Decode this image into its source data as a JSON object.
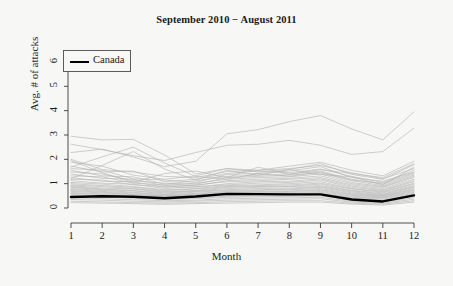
{
  "chart_data": {
    "type": "line",
    "title": "September 2010 − August 2011",
    "xlabel": "Month",
    "ylabel": "Avg. # of attacks",
    "x": [
      1,
      2,
      3,
      4,
      5,
      6,
      7,
      8,
      9,
      10,
      11,
      12
    ],
    "xticklabels": [
      "1",
      "2",
      "3",
      "4",
      "5",
      "6",
      "7",
      "8",
      "9",
      "10",
      "11",
      "12"
    ],
    "yticklabels": [
      "0",
      "1",
      "2",
      "3",
      "4",
      "5",
      "6"
    ],
    "xlim": [
      1,
      12
    ],
    "ylim": [
      0,
      6.3
    ],
    "grid": false,
    "legend": {
      "position": "top-left",
      "entries": [
        {
          "label": "Canada",
          "color": "#000000",
          "linewidth": 2.4
        }
      ]
    },
    "highlight_color": "#000000",
    "other_series_color": "#b4b4b4",
    "background_color": "#f7f7f6",
    "series": [
      {
        "name": "Canada",
        "highlight": true,
        "values": [
          0.45,
          0.48,
          0.46,
          0.4,
          0.47,
          0.58,
          0.57,
          0.56,
          0.56,
          0.35,
          0.27,
          0.52
        ]
      },
      {
        "name": "Country 1",
        "highlight": false,
        "values": [
          2.95,
          2.8,
          2.82,
          2.18,
          1.4,
          1.62,
          1.55,
          1.72,
          1.88,
          1.55,
          1.32,
          1.92
        ]
      },
      {
        "name": "Country 2",
        "highlight": false,
        "values": [
          2.62,
          2.4,
          2.15,
          1.95,
          2.28,
          2.58,
          2.62,
          2.78,
          2.58,
          2.2,
          2.32,
          3.28
        ]
      },
      {
        "name": "Country 3",
        "highlight": false,
        "values": [
          2.28,
          2.42,
          2.1,
          1.7,
          1.92,
          3.05,
          3.22,
          3.55,
          3.8,
          3.25,
          2.8,
          3.95
        ]
      },
      {
        "name": "Country 4",
        "highlight": false,
        "values": [
          2.0,
          1.58,
          1.48,
          1.3,
          1.25,
          1.5,
          1.55,
          1.62,
          1.75,
          1.45,
          1.2,
          1.62
        ]
      },
      {
        "name": "Country 5",
        "highlight": false,
        "values": [
          1.88,
          1.72,
          1.35,
          1.18,
          1.32,
          1.62,
          1.48,
          1.58,
          1.82,
          1.38,
          1.18,
          1.78
        ]
      },
      {
        "name": "Country 6",
        "highlight": false,
        "values": [
          1.72,
          1.48,
          1.52,
          1.08,
          1.18,
          1.42,
          1.52,
          1.45,
          1.6,
          1.3,
          1.05,
          1.55
        ]
      },
      {
        "name": "Country 7",
        "highlight": false,
        "values": [
          1.62,
          1.55,
          1.2,
          1.15,
          1.05,
          1.38,
          1.42,
          1.52,
          1.7,
          1.25,
          1.1,
          1.48
        ]
      },
      {
        "name": "Country 8",
        "highlight": false,
        "values": [
          1.55,
          1.32,
          1.28,
          0.98,
          1.12,
          1.3,
          1.35,
          1.4,
          1.52,
          1.18,
          0.98,
          1.4
        ]
      },
      {
        "name": "Country 9",
        "highlight": false,
        "values": [
          1.48,
          1.4,
          1.12,
          1.02,
          0.98,
          1.25,
          1.3,
          1.35,
          1.45,
          1.12,
          0.92,
          1.35
        ]
      },
      {
        "name": "Country 10",
        "highlight": false,
        "values": [
          1.4,
          1.22,
          1.18,
          0.92,
          1.02,
          1.18,
          1.25,
          1.28,
          1.4,
          1.05,
          0.88,
          1.3
        ]
      },
      {
        "name": "Country 11",
        "highlight": false,
        "values": [
          1.32,
          1.28,
          1.02,
          0.95,
          0.92,
          1.12,
          1.18,
          1.22,
          1.32,
          1.0,
          0.85,
          1.25
        ]
      },
      {
        "name": "Country 12",
        "highlight": false,
        "values": [
          1.25,
          1.1,
          1.08,
          0.85,
          0.95,
          1.08,
          1.12,
          1.18,
          1.25,
          0.95,
          0.8,
          1.18
        ]
      },
      {
        "name": "Country 13",
        "highlight": false,
        "values": [
          1.18,
          1.15,
          0.95,
          0.88,
          0.85,
          1.0,
          1.08,
          1.1,
          1.2,
          0.9,
          0.75,
          1.12
        ]
      },
      {
        "name": "Country 14",
        "highlight": false,
        "values": [
          1.12,
          1.02,
          0.98,
          0.8,
          0.88,
          0.95,
          1.02,
          1.05,
          1.15,
          0.85,
          0.72,
          1.08
        ]
      },
      {
        "name": "Country 15",
        "highlight": false,
        "values": [
          1.05,
          0.98,
          0.88,
          0.75,
          0.8,
          0.92,
          0.95,
          1.0,
          1.08,
          0.8,
          0.68,
          1.02
        ]
      },
      {
        "name": "Country 16",
        "highlight": false,
        "values": [
          1.0,
          0.92,
          0.85,
          0.72,
          0.78,
          0.88,
          0.92,
          0.95,
          1.02,
          0.78,
          0.65,
          0.98
        ]
      },
      {
        "name": "Country 17",
        "highlight": false,
        "values": [
          0.95,
          0.88,
          0.8,
          0.68,
          0.72,
          0.85,
          0.88,
          0.9,
          0.98,
          0.72,
          0.62,
          0.92
        ]
      },
      {
        "name": "Country 18",
        "highlight": false,
        "values": [
          0.92,
          0.82,
          0.78,
          0.65,
          0.7,
          0.8,
          0.85,
          0.88,
          0.92,
          0.7,
          0.58,
          0.88
        ]
      },
      {
        "name": "Country 19",
        "highlight": false,
        "values": [
          0.88,
          0.78,
          0.72,
          0.62,
          0.68,
          0.75,
          0.8,
          0.82,
          0.88,
          0.66,
          0.55,
          0.85
        ]
      },
      {
        "name": "Country 20",
        "highlight": false,
        "values": [
          0.85,
          0.75,
          0.7,
          0.58,
          0.65,
          0.72,
          0.75,
          0.78,
          0.85,
          0.62,
          0.52,
          0.8
        ]
      },
      {
        "name": "Country 21",
        "highlight": false,
        "values": [
          0.8,
          0.72,
          0.65,
          0.55,
          0.6,
          0.68,
          0.72,
          0.75,
          0.8,
          0.58,
          0.5,
          0.76
        ]
      },
      {
        "name": "Country 22",
        "highlight": false,
        "values": [
          0.76,
          0.68,
          0.62,
          0.52,
          0.58,
          0.65,
          0.68,
          0.7,
          0.76,
          0.55,
          0.48,
          0.72
        ]
      },
      {
        "name": "Country 23",
        "highlight": false,
        "values": [
          0.72,
          0.65,
          0.58,
          0.5,
          0.55,
          0.62,
          0.65,
          0.68,
          0.72,
          0.52,
          0.45,
          0.68
        ]
      },
      {
        "name": "Country 24",
        "highlight": false,
        "values": [
          0.68,
          0.62,
          0.55,
          0.48,
          0.52,
          0.58,
          0.62,
          0.64,
          0.68,
          0.48,
          0.42,
          0.64
        ]
      },
      {
        "name": "Country 25",
        "highlight": false,
        "values": [
          0.64,
          0.58,
          0.52,
          0.45,
          0.48,
          0.55,
          0.58,
          0.6,
          0.64,
          0.45,
          0.4,
          0.6
        ]
      },
      {
        "name": "Country 26",
        "highlight": false,
        "values": [
          0.6,
          0.55,
          0.48,
          0.42,
          0.45,
          0.52,
          0.55,
          0.56,
          0.6,
          0.42,
          0.36,
          0.56
        ]
      },
      {
        "name": "Country 27",
        "highlight": false,
        "values": [
          0.56,
          0.5,
          0.45,
          0.38,
          0.42,
          0.48,
          0.5,
          0.52,
          0.56,
          0.38,
          0.32,
          0.52
        ]
      },
      {
        "name": "Country 28",
        "highlight": false,
        "values": [
          0.5,
          0.45,
          0.4,
          0.35,
          0.38,
          0.44,
          0.46,
          0.48,
          0.5,
          0.34,
          0.28,
          0.48
        ]
      },
      {
        "name": "Country 29",
        "highlight": false,
        "values": [
          0.42,
          0.38,
          0.34,
          0.3,
          0.32,
          0.38,
          0.4,
          0.42,
          0.44,
          0.28,
          0.24,
          0.42
        ]
      },
      {
        "name": "Country 30",
        "highlight": false,
        "values": [
          0.35,
          0.32,
          0.28,
          0.25,
          0.28,
          0.32,
          0.34,
          0.36,
          0.38,
          0.24,
          0.2,
          0.36
        ]
      },
      {
        "name": "Country 31",
        "highlight": false,
        "values": [
          0.28,
          0.25,
          0.22,
          0.2,
          0.22,
          0.26,
          0.28,
          0.3,
          0.3,
          0.2,
          0.16,
          0.3
        ]
      },
      {
        "name": "Country 32",
        "highlight": false,
        "values": [
          0.22,
          0.2,
          0.18,
          0.15,
          0.18,
          0.2,
          0.22,
          0.24,
          0.24,
          0.16,
          0.12,
          0.24
        ]
      },
      {
        "name": "Country 33",
        "highlight": false,
        "values": [
          1.68,
          2.1,
          2.5,
          1.85,
          1.3,
          1.18,
          1.42,
          1.3,
          1.48,
          1.15,
          1.02,
          1.45
        ]
      },
      {
        "name": "Country 34",
        "highlight": false,
        "values": [
          1.2,
          1.75,
          2.32,
          1.6,
          1.15,
          1.55,
          1.35,
          1.58,
          1.38,
          1.28,
          0.95,
          1.68
        ]
      },
      {
        "name": "Country 35",
        "highlight": false,
        "values": [
          1.95,
          1.45,
          1.05,
          1.42,
          1.52,
          1.25,
          1.68,
          1.38,
          1.58,
          1.42,
          1.25,
          1.82
        ]
      }
    ]
  },
  "axes": {
    "title": "September 2010 − August 2011",
    "x_title": "Month",
    "y_title": "Avg. # of attacks"
  },
  "legend": {
    "canada_label": "Canada"
  }
}
